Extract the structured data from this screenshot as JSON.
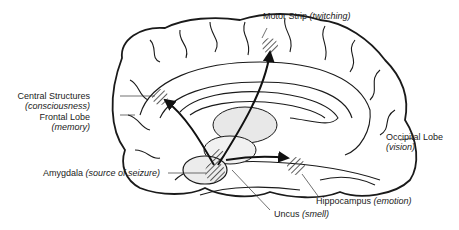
{
  "labels": {
    "motor_strip": {
      "name": "Motor Strip",
      "function": "(twitching)"
    },
    "central_structures": {
      "name": "Central Structures",
      "function": "(consciousness)"
    },
    "frontal_lobe": {
      "name": "Frontal Lobe",
      "function": "(memory)"
    },
    "occipital_lobe": {
      "name": "Occipital Lobe",
      "function": "(vision)"
    },
    "amygdala": {
      "name": "Amygdala",
      "function": "(source of seizure)"
    },
    "hippocampus": {
      "name": "Hippocampus",
      "function": "(emotion)"
    },
    "uncus": {
      "name": "Uncus",
      "function": "(smell)"
    }
  },
  "colors": {
    "line": "#1a1a1a",
    "hatch": "#333333",
    "background": "#ffffff"
  }
}
